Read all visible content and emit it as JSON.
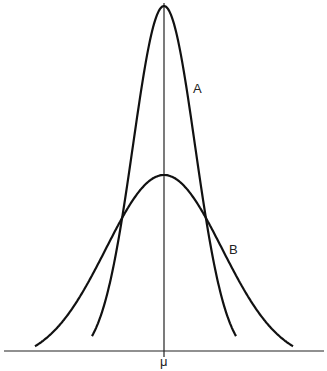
{
  "chart_data": {
    "type": "line",
    "title": "",
    "xlabel": "",
    "ylabel": "",
    "x_ticks": [
      "μ"
    ],
    "grid": false,
    "legend": "inline curve labels",
    "series": [
      {
        "name": "A",
        "description": "narrow normal curve, small standard deviation",
        "mean": "μ",
        "relative_peak": 1.0,
        "relative_sigma": 0.5
      },
      {
        "name": "B",
        "description": "wide normal curve, large standard deviation",
        "mean": "μ",
        "relative_peak": 0.5,
        "relative_sigma": 1.0
      }
    ]
  },
  "labels": {
    "curve_a": "A",
    "curve_b": "B",
    "mean": "μ"
  },
  "colors": {
    "line": "#111111",
    "background": "#ffffff"
  }
}
